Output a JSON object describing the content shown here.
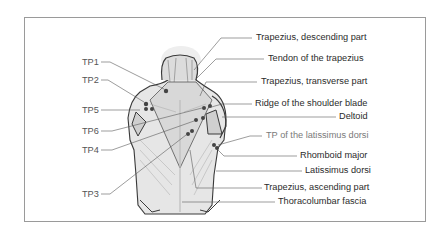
{
  "diagram": {
    "left_labels": [
      {
        "id": "TP1",
        "text": "TP1"
      },
      {
        "id": "TP2",
        "text": "TP2"
      },
      {
        "id": "TP5",
        "text": "TP5"
      },
      {
        "id": "TP6",
        "text": "TP6"
      },
      {
        "id": "TP4",
        "text": "TP4"
      },
      {
        "id": "TP3",
        "text": "TP3"
      }
    ],
    "right_labels": [
      {
        "text": "Trapezius, descending part"
      },
      {
        "text": "Tendon of the trapezius"
      },
      {
        "text": "Trapezius, transverse part"
      },
      {
        "text": "Ridge of the shoulder blade"
      },
      {
        "text": "Deltoid"
      },
      {
        "text": "TP of the latissimus dorsi"
      },
      {
        "text": "Rhomboid major"
      },
      {
        "text": "Latissimus dorsi"
      },
      {
        "text": "Trapezius, ascending part"
      },
      {
        "text": "Thoracolumbar fascia"
      }
    ],
    "colors": {
      "frame": "#9a9a9a",
      "leader_line": "#5a5a5a",
      "muscle_fill": "#e4e4e4",
      "outline": "#3a3a3a",
      "trigger_point": "#444444",
      "label_text": "#2b2b2b",
      "muted_label_text": "#7a7a7a"
    }
  }
}
